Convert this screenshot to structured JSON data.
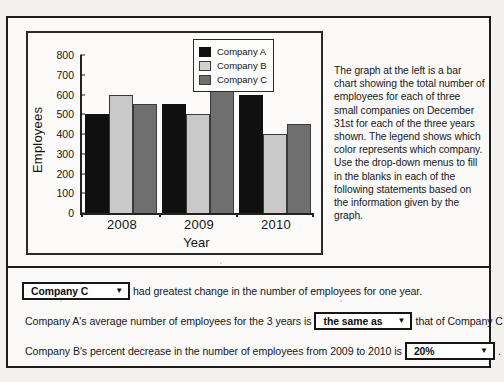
{
  "chart_data": {
    "type": "bar",
    "title": "",
    "xlabel": "Year",
    "ylabel": "Employees",
    "categories": [
      "2008",
      "2009",
      "2010"
    ],
    "series": [
      {
        "name": "Company A",
        "values": [
          500,
          550,
          600
        ],
        "color": "#101010"
      },
      {
        "name": "Company B",
        "values": [
          600,
          500,
          400
        ],
        "color": "#c9c9c9"
      },
      {
        "name": "Company C",
        "values": [
          550,
          650,
          450
        ],
        "color": "#6f6f6f"
      }
    ],
    "ylim": [
      0,
      800
    ],
    "yticks": [
      0,
      100,
      200,
      300,
      400,
      500,
      600,
      700,
      800
    ],
    "grid": false,
    "legend_position": "top-right"
  },
  "description": {
    "text": "The graph at the left is a bar chart showing the total number of employees for each of three small companies on December 31st for each of the three years shown. The legend shows which color represents which company. Use the drop-down menus to fill in the blanks in each of the following statements based on the information given by the graph."
  },
  "statements": [
    {
      "id": "statement-1",
      "dropdown_value": "Company C",
      "text_after": "had greatest change in the number of employees for one year.",
      "text_before": ""
    },
    {
      "id": "statement-2",
      "text_before": "Company A's average number of employees for the 3 years is",
      "dropdown_value": "the same as",
      "text_after": "that of Company C."
    },
    {
      "id": "statement-3",
      "text_before": "Company B's percent decrease in the number of employees from 2009 to 2010 is",
      "dropdown_value": "20%",
      "text_after": "."
    }
  ],
  "icons": {
    "dropdown_arrow": "▼"
  }
}
